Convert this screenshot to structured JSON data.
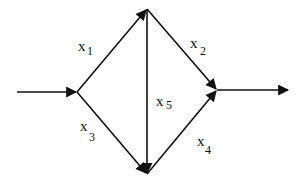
{
  "diagram": {
    "type": "directed-network",
    "nodes": [
      {
        "id": "source",
        "x": 77,
        "y": 92
      },
      {
        "id": "top",
        "x": 147,
        "y": 9
      },
      {
        "id": "bottom",
        "x": 147,
        "y": 174
      },
      {
        "id": "sink",
        "x": 217,
        "y": 90
      }
    ],
    "edges": [
      {
        "id": "input",
        "from": "start",
        "to": "source",
        "label": ""
      },
      {
        "id": "x1",
        "from": "source",
        "to": "top",
        "label": "x",
        "subscript": "1"
      },
      {
        "id": "x2",
        "from": "top",
        "to": "sink",
        "label": "x",
        "subscript": "2"
      },
      {
        "id": "x3",
        "from": "source",
        "to": "bottom",
        "label": "x",
        "subscript": "3"
      },
      {
        "id": "x4",
        "from": "bottom",
        "to": "sink",
        "label": "x",
        "subscript": "4"
      },
      {
        "id": "x5",
        "from": "top",
        "to": "bottom",
        "label": "x",
        "subscript": "5"
      },
      {
        "id": "output",
        "from": "sink",
        "to": "end",
        "label": ""
      }
    ]
  },
  "labels": {
    "x1": {
      "main": "x",
      "sub": "1"
    },
    "x2": {
      "main": "x",
      "sub": "2"
    },
    "x3": {
      "main": "x",
      "sub": "3"
    },
    "x4": {
      "main": "x",
      "sub": "4"
    },
    "x5": {
      "main": "x",
      "sub": "5"
    }
  },
  "colors": {
    "stroke": "#111111",
    "background": "#ffffff"
  }
}
